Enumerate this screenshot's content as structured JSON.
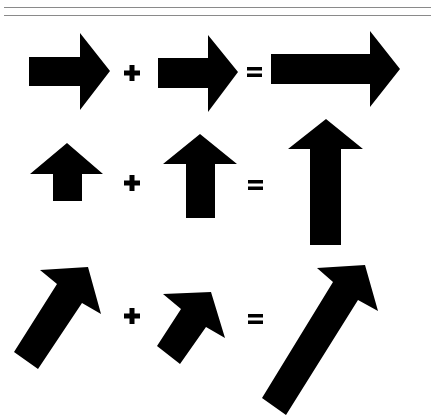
{
  "figure": {
    "fill_color": "#000000",
    "background_color": "#ffffff",
    "rule_color": "#8a8a8a",
    "rows": [
      {
        "name": "horizontal",
        "operands": [
          "right-arrow-small",
          "right-arrow-small"
        ],
        "operator": "+",
        "equals": "=",
        "result": "right-arrow-long",
        "arrows": [
          {
            "points": "29,57 80,57 80,33 110,71 80,110 80,86 29,86"
          },
          {
            "points": "158,58 208,58 208,35 238,72 208,112 208,88 158,88"
          },
          {
            "points": "271,54 370,54 370,31 400,69 370,107 370,84 271,84"
          }
        ],
        "plus": {
          "cx": 132,
          "cy": 73
        },
        "equal": {
          "x": 247,
          "y": 67
        }
      },
      {
        "name": "vertical",
        "operands": [
          "up-arrow-small",
          "up-arrow-medium"
        ],
        "operator": "+",
        "equals": "=",
        "result": "up-arrow-long",
        "arrows": [
          {
            "points": "67,143 103,174 82,174 82,201 53,201 53,174 30,174"
          },
          {
            "points": "200,134 237,164 215,164 215,218 186,218 186,164 163,164"
          },
          {
            "points": "326,119 363,149 341,149 341,245 310,245 310,149 288,149"
          }
        ],
        "plus": {
          "cx": 132,
          "cy": 183
        },
        "equal": {
          "x": 248,
          "y": 180
        }
      },
      {
        "name": "diagonal",
        "operands": [
          "diagonal-arrow-large",
          "diagonal-arrow-small"
        ],
        "operator": "+",
        "equals": "=",
        "result": "diagonal-arrow-long",
        "arrows": [
          {
            "points": "88,267 101,314 82,303 38,369 14,352 57,284 40,270"
          },
          {
            "points": "211,292 225,338 206,327 180,364 157,346 181,309 163,294"
          },
          {
            "points": "365,265 378,311 358,300 286,415 262,398 333,282 317,268"
          }
        ],
        "plus": {
          "cx": 132,
          "cy": 316
        },
        "equal": {
          "x": 248,
          "y": 314
        }
      }
    ]
  }
}
